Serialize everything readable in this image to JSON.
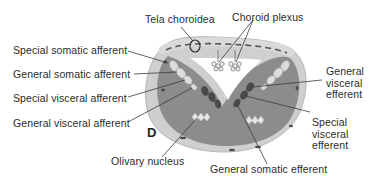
{
  "figure": {
    "panel_letter": "D",
    "colors": {
      "outer_rim": "#c9c9c9",
      "interior": "#8a8a8a",
      "afferent_nucleus": "#d9d9d9",
      "efferent_nucleus": "#4a4a4a",
      "leader_line": "#3a3a3a",
      "tela": "#d0d0d0",
      "tela_dash": "#555555"
    },
    "labels": {
      "tela_choroidea": "Tela choroidea",
      "choroid_plexus": "Choroid plexus",
      "special_somatic_afferent": "Special somatic afferent",
      "general_somatic_afferent": "General somatic afferent",
      "special_visceral_afferent": "Special visceral afferent",
      "general_visceral_afferent": "General visceral afferent",
      "olivary_nucleus": "Olivary nucleus",
      "general_somatic_efferent": "General somatic efferent",
      "general_visceral_efferent_line1": "General",
      "general_visceral_efferent_line2": "visceral",
      "general_visceral_efferent_line3": "efferent",
      "special_visceral_efferent_line1": "Special",
      "special_visceral_efferent_line2": "visceral",
      "special_visceral_efferent_line3": "efferent"
    }
  }
}
